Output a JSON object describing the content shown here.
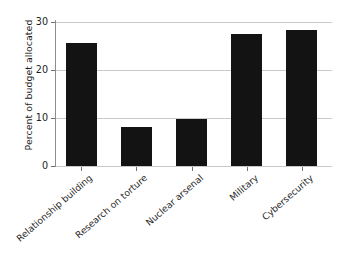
{
  "chart_data": {
    "type": "bar",
    "title": "",
    "xlabel": "",
    "ylabel": "Percent of budget allocated",
    "categories": [
      "Relationship building",
      "Research on torture",
      "Nuclear arsenal",
      "Military",
      "Cybersecurity"
    ],
    "values": [
      25.7,
      8.1,
      9.7,
      27.6,
      28.4
    ],
    "ylim": [
      0,
      30
    ],
    "yticks": [
      0,
      10,
      20,
      30
    ],
    "ytick_labels": [
      "0",
      "10",
      "20",
      "30"
    ],
    "grid": true,
    "legend": false,
    "bar_color": "#131313",
    "gridline_color": "#c9c9c9",
    "axis_color": "#8d8d8d",
    "background_color": "#ffffff"
  }
}
